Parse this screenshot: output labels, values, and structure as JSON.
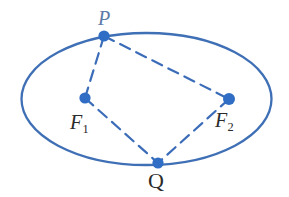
{
  "figure": {
    "kind": "ellipse-foci-diagram",
    "width": 289,
    "height": 197,
    "background_color": "#ffffff"
  },
  "colors": {
    "ellipse_stroke": "#3f6fb5",
    "segment_stroke": "#3b6cb8",
    "point_fill": "#2f6ec4",
    "label_dark": "#2b2b2b",
    "label_blue": "#5c7ba8"
  },
  "ellipse": {
    "center_x": 146.5,
    "center_y": 99,
    "radius_x": 125,
    "radius_y": 66,
    "stroke_width": 2.3
  },
  "points": [
    {
      "id": "P",
      "label": "P",
      "x": 104,
      "y": 36,
      "radius": 5.6,
      "on_curve": true,
      "label_x": 98,
      "label_y": 8,
      "label_style": "italic-blue"
    },
    {
      "id": "F1",
      "label": "F",
      "subscript": "1",
      "x": 85,
      "y": 98,
      "radius": 5.6,
      "on_curve": false,
      "label_x": 70,
      "label_y": 112,
      "label_style": "italic-dark"
    },
    {
      "id": "F2",
      "label": "F",
      "subscript": "2",
      "x": 229,
      "y": 99,
      "radius": 6.0,
      "on_curve": false,
      "label_x": 215,
      "label_y": 110,
      "label_style": "italic-dark"
    },
    {
      "id": "Q",
      "label": "Q",
      "x": 158,
      "y": 163,
      "radius": 5.6,
      "on_curve": true,
      "label_x": 148,
      "label_y": 170,
      "label_style": "upright-dark"
    }
  ],
  "segments": [
    {
      "id": "P-F1",
      "from": "P",
      "to": "F1",
      "x1": 104,
      "y1": 36,
      "x2": 85,
      "y2": 98,
      "style": "dashed",
      "dash": "11 7",
      "stroke_width": 2.2
    },
    {
      "id": "P-F2",
      "from": "P",
      "to": "F2",
      "x1": 104,
      "y1": 36,
      "x2": 229,
      "y2": 99,
      "style": "dashed",
      "dash": "11 7",
      "stroke_width": 2.2
    },
    {
      "id": "F1-Q",
      "from": "F1",
      "to": "Q",
      "x1": 85,
      "y1": 98,
      "x2": 158,
      "y2": 163,
      "style": "dashed",
      "dash": "11 7",
      "stroke_width": 2.2
    },
    {
      "id": "F2-Q",
      "from": "F2",
      "to": "Q",
      "x1": 229,
      "y1": 99,
      "x2": 158,
      "y2": 163,
      "style": "dashed",
      "dash": "11 7",
      "stroke_width": 2.2
    }
  ]
}
